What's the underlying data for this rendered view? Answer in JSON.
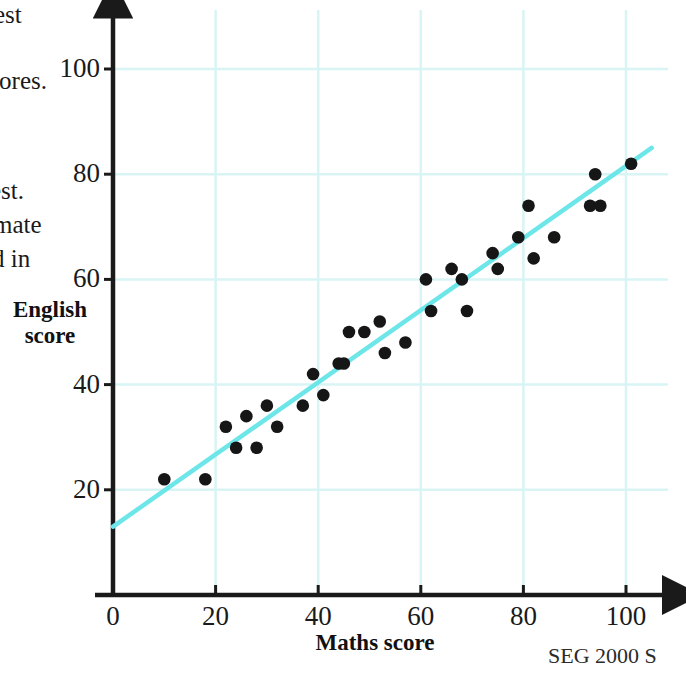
{
  "margin_fragments": [
    {
      "text": "est"
    },
    {
      "text": "cores."
    },
    {
      "text": "est."
    },
    {
      "text": "imate"
    },
    {
      "text": "d in"
    }
  ],
  "credit": "SEG 2000 S",
  "colors": {
    "grid": "#d8f4f4",
    "trend_line": "#6de6ea",
    "axis": "#1a1a1a",
    "point": "#161616",
    "background": "#ffffff"
  },
  "chart_data": {
    "type": "scatter",
    "title": "",
    "xlabel": "Maths score",
    "ylabel": "English score",
    "xlim": [
      0,
      110
    ],
    "ylim": [
      0,
      110
    ],
    "xticks": [
      0,
      20,
      40,
      60,
      80,
      100
    ],
    "yticks": [
      20,
      40,
      60,
      80,
      100
    ],
    "xtick_labels": [
      "0",
      "20",
      "40",
      "60",
      "80",
      "100"
    ],
    "ytick_labels": [
      "20",
      "40",
      "60",
      "80",
      "100"
    ],
    "grid": true,
    "grid_spacing": 20,
    "legend": null,
    "axis_style": "arrow",
    "points": [
      {
        "x": 10,
        "y": 22
      },
      {
        "x": 18,
        "y": 22
      },
      {
        "x": 22,
        "y": 32
      },
      {
        "x": 24,
        "y": 28
      },
      {
        "x": 26,
        "y": 34
      },
      {
        "x": 28,
        "y": 28
      },
      {
        "x": 30,
        "y": 36
      },
      {
        "x": 32,
        "y": 32
      },
      {
        "x": 37,
        "y": 36
      },
      {
        "x": 39,
        "y": 42
      },
      {
        "x": 41,
        "y": 38
      },
      {
        "x": 44,
        "y": 44
      },
      {
        "x": 45,
        "y": 44
      },
      {
        "x": 46,
        "y": 50
      },
      {
        "x": 49,
        "y": 50
      },
      {
        "x": 52,
        "y": 52
      },
      {
        "x": 53,
        "y": 46
      },
      {
        "x": 57,
        "y": 48
      },
      {
        "x": 61,
        "y": 60
      },
      {
        "x": 62,
        "y": 54
      },
      {
        "x": 66,
        "y": 62
      },
      {
        "x": 68,
        "y": 60
      },
      {
        "x": 69,
        "y": 54
      },
      {
        "x": 74,
        "y": 65
      },
      {
        "x": 75,
        "y": 62
      },
      {
        "x": 79,
        "y": 68
      },
      {
        "x": 81,
        "y": 74
      },
      {
        "x": 82,
        "y": 64
      },
      {
        "x": 86,
        "y": 68
      },
      {
        "x": 93,
        "y": 74
      },
      {
        "x": 94,
        "y": 80
      },
      {
        "x": 95,
        "y": 74
      },
      {
        "x": 101,
        "y": 82
      }
    ],
    "trend_line": {
      "label": "line of best fit",
      "x_start": 0,
      "y_start": 13,
      "x_end": 105,
      "y_end": 85
    }
  }
}
